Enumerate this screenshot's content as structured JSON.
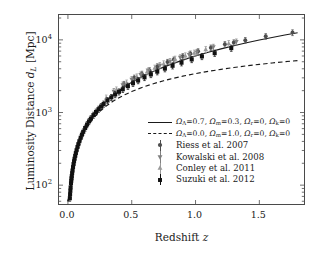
{
  "figure": {
    "background": "#ffffff",
    "frame_color": "#4a4a4a"
  },
  "axes": {
    "xlabel_pre": "Redshift ",
    "xlabel_var": "z",
    "ylabel_pre": "Luminosity Distance ",
    "ylabel_var": "d",
    "ylabel_var_sub": "L",
    "ylabel_post": " [Mpc]",
    "xticks": [
      "0.0",
      "0.5",
      "1.0",
      "1.5"
    ],
    "xtick_values": [
      0.0,
      0.5,
      1.0,
      1.5
    ],
    "ytick_base": "10",
    "ytick_exponents": [
      "2",
      "3",
      "4"
    ],
    "ytick_values": [
      100,
      1000,
      10000
    ],
    "xlim": [
      -0.07,
      1.85
    ],
    "ylim": [
      55,
      22000
    ],
    "yscale": "log",
    "xscale": "linear"
  },
  "legend": {
    "position": "center-right-lower",
    "entries": [
      {
        "key": "solid-line",
        "text": "ΩΛ=0.7, Ωm=0.3, Ωr=0, Ωk=0",
        "omega_lambda": 0.7,
        "omega_m": 0.3,
        "omega_r": 0,
        "omega_k": 0,
        "style": "solid",
        "color": "#1a1a1a"
      },
      {
        "key": "dashed-line",
        "text": "ΩΛ=0.0, Ωm=1.0, Ωr=0, Ωk=0",
        "omega_lambda": 0.0,
        "omega_m": 1.0,
        "omega_r": 0,
        "omega_k": 0,
        "style": "dashed",
        "color": "#1a1a1a"
      },
      {
        "key": "riess",
        "text": "Riess et al. 2007",
        "marker": "circle",
        "color": "#4d4d4d"
      },
      {
        "key": "kowalski",
        "text": "Kowalski et al. 2008",
        "marker": "triangle-down",
        "color": "#808080"
      },
      {
        "key": "conley",
        "text": "Conley et al. 2011",
        "marker": "triangle-up",
        "color": "#999999"
      },
      {
        "key": "suzuki",
        "text": "Suzuki et al. 2012",
        "marker": "square",
        "color": "#111111"
      }
    ]
  },
  "chart_data": {
    "type": "scatter",
    "title": "",
    "xlabel": "Redshift z",
    "ylabel": "Luminosity Distance d_L [Mpc]",
    "xlim": [
      -0.07,
      1.85
    ],
    "ylim": [
      55,
      22000
    ],
    "yscale": "log",
    "grid": false,
    "legend_position": "center",
    "series": [
      {
        "name": "Riess et al. 2007",
        "marker": "circle",
        "color": "#4d4d4d",
        "x": [
          0.44,
          0.52,
          0.58,
          0.64,
          0.7,
          0.78,
          0.83,
          0.9,
          0.96,
          1.02,
          1.12,
          1.23,
          1.3,
          1.39,
          1.55,
          1.76
        ],
        "y": [
          2450,
          3000,
          3400,
          3800,
          4300,
          4950,
          5350,
          5950,
          6450,
          6950,
          7800,
          8700,
          9200,
          9900,
          11200,
          12600
        ],
        "yerr": [
          230,
          270,
          300,
          330,
          380,
          430,
          460,
          510,
          560,
          600,
          680,
          760,
          800,
          860,
          980,
          1150
        ]
      },
      {
        "name": "Kowalski et al. 2008",
        "marker": "triangle-down",
        "color": "#808080",
        "x": [
          0.36,
          0.43,
          0.5,
          0.57,
          0.63,
          0.72,
          0.8,
          0.88,
          0.95,
          1.01,
          1.14,
          1.32
        ],
        "y": [
          1950,
          2400,
          2850,
          3300,
          3750,
          4450,
          5050,
          5700,
          6250,
          6750,
          7950,
          9400
        ],
        "yerr": [
          190,
          230,
          270,
          310,
          350,
          410,
          470,
          530,
          580,
          630,
          740,
          880
        ]
      },
      {
        "name": "Conley et al. 2011",
        "marker": "triangle-up",
        "color": "#999999",
        "x": [
          0.3,
          0.38,
          0.46,
          0.54,
          0.62,
          0.68,
          0.75,
          0.84,
          0.92,
          0.99,
          1.08,
          1.26
        ],
        "y": [
          1580,
          2050,
          2550,
          3100,
          3650,
          4100,
          4700,
          5450,
          6050,
          6600,
          7400,
          8950
        ],
        "yerr": [
          160,
          200,
          250,
          300,
          350,
          390,
          450,
          520,
          580,
          630,
          710,
          850
        ]
      },
      {
        "name": "Suzuki et al. 2012",
        "marker": "square",
        "color": "#111111",
        "x": [
          0.015,
          0.017,
          0.019,
          0.021,
          0.024,
          0.026,
          0.028,
          0.03,
          0.033,
          0.036,
          0.04,
          0.044,
          0.048,
          0.052,
          0.057,
          0.062,
          0.068,
          0.075,
          0.082,
          0.09,
          0.1,
          0.11,
          0.12,
          0.135,
          0.15,
          0.165,
          0.18,
          0.2,
          0.22,
          0.24,
          0.26,
          0.28,
          0.31,
          0.34,
          0.37,
          0.4,
          0.43,
          0.47,
          0.51,
          0.55,
          0.6,
          0.65,
          0.7,
          0.76,
          0.82,
          0.89,
          0.97,
          1.05,
          1.15,
          1.28
        ],
        "y": [
          66,
          75,
          84,
          93,
          106,
          115,
          124,
          133,
          146,
          159,
          177,
          195,
          213,
          231,
          253,
          276,
          303,
          335,
          367,
          403,
          449,
          496,
          542,
          612,
          683,
          754,
          825,
          920,
          1015,
          1112,
          1210,
          1310,
          1462,
          1615,
          1770,
          1928,
          2088,
          2305,
          2528,
          2755,
          3045,
          3345,
          3650,
          4020,
          4400,
          4850,
          5380,
          5920,
          6560,
          7700
        ],
        "yerr": [
          6,
          7,
          8,
          9,
          10,
          11,
          12,
          13,
          14,
          15,
          17,
          19,
          21,
          22,
          24,
          27,
          29,
          32,
          35,
          39,
          43,
          48,
          52,
          59,
          66,
          73,
          80,
          89,
          98,
          108,
          117,
          127,
          141,
          156,
          171,
          186,
          202,
          223,
          244,
          266,
          294,
          323,
          353,
          389,
          425,
          469,
          520,
          572,
          634,
          744
        ]
      }
    ],
    "curves": [
      {
        "name": "LambdaCDM",
        "style": "solid",
        "color": "#1a1a1a",
        "omega_lambda": 0.7,
        "omega_m": 0.3,
        "x": [
          0.0,
          0.02,
          0.05,
          0.08,
          0.12,
          0.16,
          0.2,
          0.25,
          0.3,
          0.35,
          0.4,
          0.45,
          0.5,
          0.55,
          0.6,
          0.65,
          0.7,
          0.75,
          0.8,
          0.85,
          0.9,
          0.95,
          1.0,
          1.1,
          1.2,
          1.3,
          1.4,
          1.5,
          1.6,
          1.7,
          1.8
        ],
        "y": [
          60,
          89,
          222,
          357,
          543,
          735,
          933,
          1189,
          1455,
          1730,
          2013,
          2305,
          2605,
          2912,
          3227,
          3549,
          3878,
          4214,
          4557,
          4906,
          5261,
          5623,
          5990,
          6741,
          7514,
          8308,
          9120,
          9950,
          10797,
          11659,
          12535
        ]
      },
      {
        "name": "EdS",
        "style": "dashed",
        "color": "#1a1a1a",
        "omega_lambda": 0.0,
        "omega_m": 1.0,
        "x": [
          0.0,
          0.02,
          0.05,
          0.08,
          0.12,
          0.16,
          0.2,
          0.25,
          0.3,
          0.35,
          0.4,
          0.45,
          0.5,
          0.55,
          0.6,
          0.65,
          0.7,
          0.75,
          0.8,
          0.85,
          0.9,
          0.95,
          1.0,
          1.1,
          1.2,
          1.3,
          1.4,
          1.5,
          1.6,
          1.7,
          1.8
        ],
        "y": [
          60,
          88,
          217,
          344,
          513,
          679,
          841,
          1038,
          1230,
          1416,
          1597,
          1773,
          1944,
          2111,
          2273,
          2431,
          2585,
          2735,
          2881,
          3024,
          3163,
          3299,
          3432,
          3687,
          3931,
          4164,
          4387,
          4601,
          4806,
          5003,
          5193
        ]
      }
    ]
  }
}
